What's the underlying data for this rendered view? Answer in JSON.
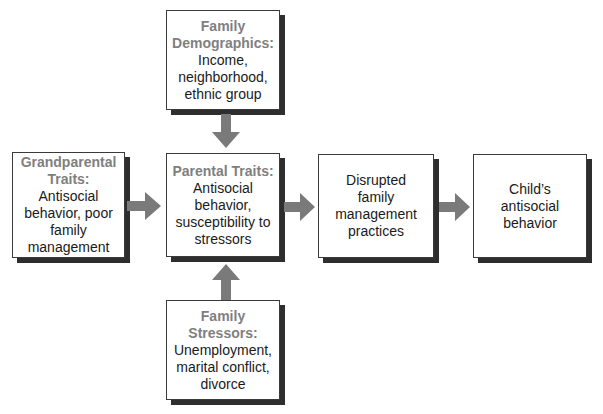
{
  "diagram": {
    "type": "flow",
    "colors": {
      "title_text": "#7f7f7f",
      "body_text": "#1a1a1a",
      "box_border": "#3a3a3a",
      "box_shadow": "#2e2e2e",
      "arrow": "#7a7a7a"
    },
    "nodes": {
      "family_demographics": {
        "title_lines": [
          "Family",
          "Demographics:"
        ],
        "body_lines": [
          "Income,",
          "neighborhood,",
          "ethnic group"
        ]
      },
      "grandparental_traits": {
        "title_lines": [
          "Grandparental",
          "Traits:"
        ],
        "body_lines": [
          "Antisocial",
          "behavior, poor",
          "family",
          "management"
        ]
      },
      "parental_traits": {
        "title_lines": [
          "Parental Traits:"
        ],
        "body_lines": [
          "Antisocial",
          "behavior,",
          "susceptibility to",
          "stressors"
        ]
      },
      "disrupted_family_management": {
        "title_lines": [],
        "body_lines": [
          "Disrupted",
          "family",
          "management",
          "practices"
        ]
      },
      "childs_antisocial_behavior": {
        "title_lines": [],
        "body_lines": [
          "Child’s",
          "antisocial",
          "behavior"
        ]
      },
      "family_stressors": {
        "title_lines": [
          "Family",
          "Stressors:"
        ],
        "body_lines": [
          "Unemployment,",
          "marital conflict,",
          "divorce"
        ]
      }
    },
    "edges": [
      {
        "from": "family_demographics",
        "to": "parental_traits",
        "direction": "down"
      },
      {
        "from": "grandparental_traits",
        "to": "parental_traits",
        "direction": "right"
      },
      {
        "from": "parental_traits",
        "to": "disrupted_family_management",
        "direction": "right"
      },
      {
        "from": "disrupted_family_management",
        "to": "childs_antisocial_behavior",
        "direction": "right"
      },
      {
        "from": "family_stressors",
        "to": "parental_traits",
        "direction": "up"
      }
    ]
  }
}
